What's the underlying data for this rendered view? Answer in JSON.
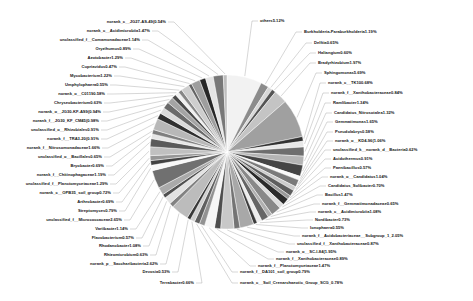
{
  "chart_data": {
    "type": "pie",
    "title": "",
    "subtitle": "",
    "xlabel": "",
    "ylabel": "",
    "legend_position": "none",
    "grid": false,
    "label_format": "name + percent",
    "palette": "grayscale",
    "slice_edge_color": "#ffffff",
    "background_color": "#ffffff",
    "leader_line_color": "#9a9a9a",
    "categories": [
      "others",
      "Burkholderia-Paraburkholderia",
      "Delftia",
      "Haliangium",
      "Bradyrhizobium",
      "Sphingomonas",
      "norank_c__TK10",
      "norank_f__Xanthobacteraceae",
      "Ramlibacter",
      "Candidatus_Nitrosotalea",
      "Gemmatimonas",
      "Pseudolabrys",
      "norank_o__KD4-96",
      "unclassified_k__norank_d__Bacteria",
      "Acidothermus",
      "Paenibacillus",
      "norank_o__Candidatus",
      "Candidatus_Solibacter",
      "Bacillus",
      "norank_f__Gemmatimonadaceae",
      "norank_c__Acidimicrobiia",
      "Nordibacter",
      "Ionophaera",
      "norank_f__Acidobacteriaceae_Subgroup_1",
      "unclassified_f__Xanthobacteraceae",
      "norank_o__SC-I-84",
      "norank_f__Xanthobacteraceae_2",
      "norank_f__Planctomycetaceae",
      "norank_f__DA101_soil_group",
      "norank_c__Soil_Crenarchaeotic_Group_SCG",
      "Terrabacter",
      "Devosia",
      "norank_p__Saccharibacteria",
      "Rhizomicrobium",
      "Rhodanobacter",
      "Flavobacterium",
      "Variibacter",
      "unclassified_f__Micrococcaceae",
      "Streptomyces",
      "Arthrobacter",
      "norank_c__OPB35_soil_group",
      "unclassified_f__Planctomycetaceae",
      "norank_f__Chitinophagaceae",
      "Bryobacter",
      "unclassified_o__Bacillales",
      "norank_f__Nitrosomonadaceae",
      "norank_f__TRA3-20",
      "unclassified_o__Rhizobiales",
      "norank_f__JG30_KF_CM45",
      "norank_o__JG30-KF-AS9",
      "Chryseobacterium",
      "norank_o__C0119",
      "Umphylophaera",
      "Mycobacterium",
      "Cupriavidus",
      "Azotobacter",
      "Oryzihumus",
      "unclassified_f__Comamonadaceae",
      "norank_c__Acidimicrobiia_2",
      "norank_c__JG27-AS-49"
    ],
    "values": [
      5.12,
      1.19,
      0.65,
      0.6,
      1.97,
      5.69,
      0.68,
      0.84,
      1.34,
      1.32,
      1.65,
      0.58,
      1.06,
      0.62,
      0.91,
      0.57,
      1.04,
      0.7,
      1.47,
      0.65,
      1.08,
      0.73,
      0.55,
      2.05,
      0.87,
      1.95,
      0.89,
      1.47,
      0.79,
      0.78,
      0.66,
      0.53,
      2.62,
      0.63,
      1.08,
      0.57,
      1.14,
      2.65,
      0.79,
      0.69,
      0.72,
      1.29,
      1.19,
      0.69,
      0.65,
      1.66,
      0.91,
      0.91,
      0.98,
      0.94,
      0.63,
      0.58,
      0.55,
      1.22,
      0.47,
      1.29,
      0.89,
      1.14,
      1.47,
      0.54
    ],
    "labels": [
      "others5.12%",
      "Burkholderia-Paraburkholderia1.19%",
      "Delftia0.65%",
      "Haliangium0.60%",
      "Bradyrhizobium1.97%",
      "Sphingomonas5.69%",
      "norank_c__TK100.68%",
      "norank_f__Xanthobacteraceae0.84%",
      "Ramlibacter1.34%",
      "Candidatus_Nitrosotalea1.32%",
      "Gemmatimonas1.65%",
      "Pseudolabrys0.58%",
      "norank_o__KD4-96(1.06%",
      "unclassified_k__norank_d__Bacteria0.62%",
      "Acidothermus0.91%",
      "Paenibacillus0.57%",
      "norank_o__Candidatus1.04%",
      "Candidatus_Solibacter0.70%",
      "Bacillus1.47%",
      "norank_f__Gemmatimonadaceae0.65%",
      "norank_c__Acidimicrobiia1.08%",
      "Nordibacter0.73%",
      "Ionophaera0.55%",
      "norank_f__Acidobacteriaceae__Subgroup_1_2.05%",
      "unclassified_f__Xanthobacteraceae0.87%",
      "norank_o__SC-I-84(1.95%",
      "norank_f__Xanthobacteraceae0.89%",
      "norank_f__Planctomycetaceae1.47%",
      "norank_f__DA101_soil_group0.79%",
      "norank_c__Soil_Crenarchaeotic_Group_SCG_0.78%",
      "Terrabacter0.66%",
      "Devosia0.53%",
      "norank_p__Saccharibacteria2.62%",
      "Rhizomicrobium0.63%",
      "Rhodanobacter1.08%",
      "Flavobacterium0.57%",
      "Variibacter1.14%",
      "unclassified_f__Micrococcaceae2.65%",
      "Streptomyces0.79%",
      "Arthrobacter0.69%",
      "norank_c__OPB35_soil_group0.72%",
      "unclassified_f__Planctomycetaceae1.29%",
      "norank_f__Chitinophagaceae1.19%",
      "Bryobacter0.69%",
      "unclassified_o__Bacillales0.65%",
      "norank_f__Nitrosomonadaceae1.66%",
      "norank_f__TRA3-20(0.91%",
      "unclassified_o__Rhizobiales0.91%",
      "norank_f__JG30_KF_CM45(0.98%",
      "norank_o__JG30-KF-AS9(0.94%",
      "Chryseobacterium0.63%",
      "norank_o__C01190.58%",
      "Umphylophaera0.55%",
      "Mycobacterium1.22%",
      "Cupriavidus0.47%",
      "Azotobacter1.29%",
      "Oryzihumus0.89%",
      "unclassified_f__Comamonadaceae1.14%",
      "norank_c__Acidimicrobiia1.47%",
      "norank_c__JG27-AS-49(0.54%"
    ]
  }
}
